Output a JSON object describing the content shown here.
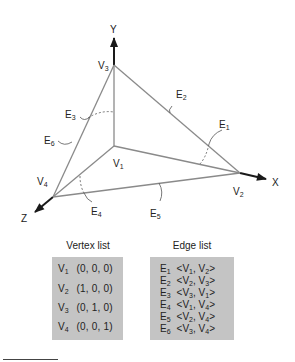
{
  "diagram": {
    "axes": {
      "x": "X",
      "y": "Y",
      "z": "Z"
    },
    "vertices": [
      {
        "id": "V",
        "sub": "1",
        "x": 114,
        "y": 146
      },
      {
        "id": "V",
        "sub": "2",
        "x": 240,
        "y": 173
      },
      {
        "id": "V",
        "sub": "3",
        "x": 114,
        "y": 65
      },
      {
        "id": "V",
        "sub": "4",
        "x": 53,
        "y": 197
      }
    ],
    "edge_labels": [
      {
        "id": "E",
        "sub": "1"
      },
      {
        "id": "E",
        "sub": "2"
      },
      {
        "id": "E",
        "sub": "3"
      },
      {
        "id": "E",
        "sub": "4"
      },
      {
        "id": "E",
        "sub": "5"
      },
      {
        "id": "E",
        "sub": "6"
      }
    ],
    "colors": {
      "line": "#8a8a8a",
      "axis": "#1a1a1a",
      "box": "#c4c4c4"
    }
  },
  "vertex_list": {
    "header": "Vertex list",
    "rows": [
      {
        "name": "V",
        "sub": "1",
        "coords": "(0, 0, 0)"
      },
      {
        "name": "V",
        "sub": "2",
        "coords": "(1, 0, 0)"
      },
      {
        "name": "V",
        "sub": "3",
        "coords": "(0, 1, 0)"
      },
      {
        "name": "V",
        "sub": "4",
        "coords": "(0, 0, 1)"
      }
    ]
  },
  "edge_list": {
    "header": "Edge list",
    "rows": [
      {
        "name": "E",
        "sub": "1",
        "a": "V",
        "asub": "1",
        "b": "V",
        "bsub": "2"
      },
      {
        "name": "E",
        "sub": "2",
        "a": "V",
        "asub": "2",
        "b": "V",
        "bsub": "3"
      },
      {
        "name": "E",
        "sub": "3",
        "a": "V",
        "asub": "3",
        "b": "V",
        "bsub": "1"
      },
      {
        "name": "E",
        "sub": "4",
        "a": "V",
        "asub": "1",
        "b": "V",
        "bsub": "4"
      },
      {
        "name": "E",
        "sub": "5",
        "a": "V",
        "asub": "2",
        "b": "V",
        "bsub": "4"
      },
      {
        "name": "E",
        "sub": "6",
        "a": "V",
        "asub": "3",
        "b": "V",
        "bsub": "4"
      }
    ]
  }
}
